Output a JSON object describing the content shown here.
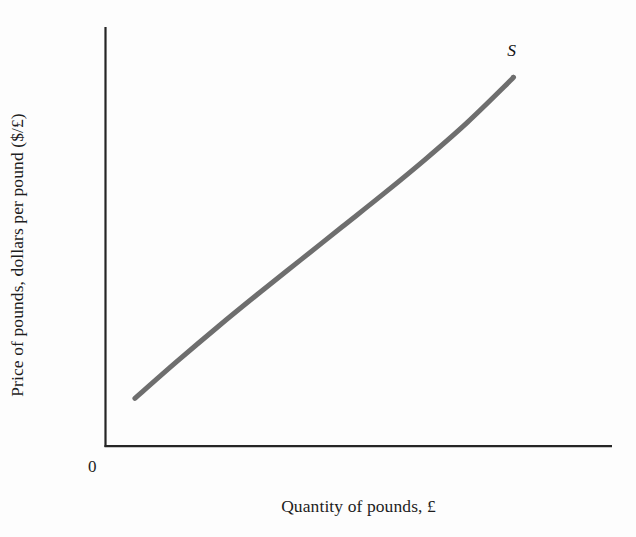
{
  "figure": {
    "background_color": "#fdfdfd",
    "axis_color": "#262626",
    "curve_color": "#6e6e6e"
  },
  "axes": {
    "y_title": "Price of pounds, dollars per pound ($/£)",
    "x_title": "Quantity of pounds, £",
    "origin_label": "0"
  },
  "annotations": {
    "supply_curve_label": "S"
  },
  "chart_data": {
    "type": "line",
    "title": "",
    "subtitle": "",
    "xlabel": "Quantity of pounds, £",
    "ylabel": "Price of pounds, dollars per pound ($/£)",
    "grid": false,
    "legend": false,
    "legend_position": "none",
    "axis_tick_labels": {
      "x": [],
      "y": []
    },
    "xlim": [
      0,
      100
    ],
    "ylim": [
      0,
      100
    ],
    "series": [
      {
        "name": "S",
        "label": "S",
        "color": "#6e6e6e",
        "linewidth": 5,
        "annotation": "S",
        "description": "Upward-sloping, slightly convex supply curve for pounds",
        "x": [
          5.8,
          14.0,
          22.2,
          30.4,
          38.6,
          46.8,
          55.0,
          63.2,
          71.4,
          79.6,
          80.5
        ],
        "y": [
          11.4,
          20.1,
          28.5,
          36.6,
          44.5,
          52.4,
          60.3,
          68.5,
          77.2,
          86.8,
          88.0
        ]
      }
    ],
    "annotations_list": [
      {
        "text": "S",
        "x": 80.5,
        "y": 94.5,
        "style": "italic"
      },
      {
        "text": "0",
        "x": -3.5,
        "y": -6.0,
        "style": "normal"
      }
    ]
  }
}
